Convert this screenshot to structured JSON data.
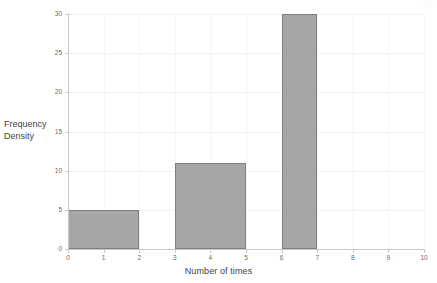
{
  "chart_data": {
    "type": "bar",
    "title": "",
    "subtitle": "",
    "xlabel": "Number of times",
    "ylabel": "Frequency Density",
    "ylabel_lines": [
      "Frequency",
      "Density"
    ],
    "xlim": [
      0,
      10
    ],
    "ylim": [
      0,
      30
    ],
    "xticks": [
      0,
      1,
      2,
      3,
      4,
      5,
      6,
      7,
      8,
      9,
      10
    ],
    "xtick_labels": [
      "0",
      "1",
      "2",
      "3",
      "4",
      "5",
      "6",
      "7",
      "8",
      "9",
      "10"
    ],
    "yticks": [
      0,
      5,
      10,
      15,
      20,
      25,
      30
    ],
    "ytick_labels": [
      "0",
      "5",
      "10",
      "15",
      "20",
      "25",
      "30"
    ],
    "grid": true,
    "legend": false,
    "legend_position": "none",
    "bar_fill_color": "#a6a6a6",
    "bar_border_color": "#7f7f7f",
    "gridline_color": "#f1f1f1",
    "axis_color": "#c9c9c9",
    "tick_label_color": "#6b6b6b",
    "axis_title_color": "#3f3f3f",
    "bars": [
      {
        "label": "0-2",
        "x_start": 0,
        "x_end": 2,
        "value": 5
      },
      {
        "label": "3-5",
        "x_start": 3,
        "x_end": 5,
        "value": 11
      },
      {
        "label": "6-7",
        "x_start": 6,
        "x_end": 7,
        "value": 30
      }
    ],
    "categories": [
      "0-2",
      "3-5",
      "6-7"
    ],
    "values": [
      5,
      11,
      30
    ]
  }
}
